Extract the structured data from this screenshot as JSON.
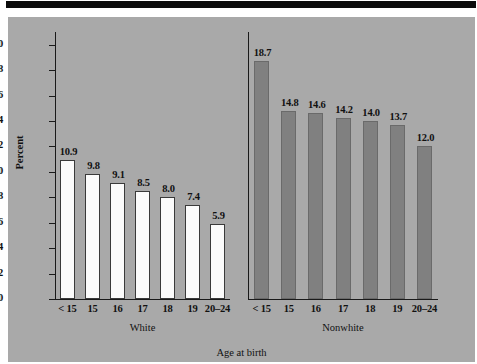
{
  "figure": {
    "background_color": "#a9a9a9",
    "top_bar_color": "#0b0b0b",
    "axis_color": "#1a1a1a"
  },
  "chart_data": {
    "type": "bar",
    "title": "",
    "xlabel": "Age at birth",
    "ylabel": "Percent",
    "ylim": [
      0,
      21
    ],
    "yticks": [
      0,
      2,
      4,
      6,
      8,
      10,
      12,
      14,
      16,
      18,
      20
    ],
    "ytick_labels": [
      "0",
      "2",
      "4",
      "6",
      "8",
      "10",
      "12",
      "14",
      "16",
      "18",
      "20"
    ],
    "grid": false,
    "legend": "none",
    "panels": [
      {
        "name": "White",
        "group_label": "White",
        "bar_color": "#fbfbfb",
        "categories": [
          "< 15",
          "15",
          "16",
          "17",
          "18",
          "19",
          "20–24"
        ],
        "values": [
          10.9,
          9.8,
          9.1,
          8.5,
          8.0,
          7.4,
          5.9
        ],
        "value_labels": [
          "10.9",
          "9.8",
          "9.1",
          "8.5",
          "8.0",
          "7.4",
          "5.9"
        ]
      },
      {
        "name": "Nonwhite",
        "group_label": "Nonwhite",
        "bar_color": "#808080",
        "categories": [
          "< 15",
          "15",
          "16",
          "17",
          "18",
          "19",
          "20–24"
        ],
        "values": [
          18.7,
          14.8,
          14.6,
          14.2,
          14.0,
          13.7,
          12.0
        ],
        "value_labels": [
          "18.7",
          "14.8",
          "14.6",
          "14.2",
          "14.0",
          "13.7",
          "12.0"
        ]
      }
    ]
  }
}
